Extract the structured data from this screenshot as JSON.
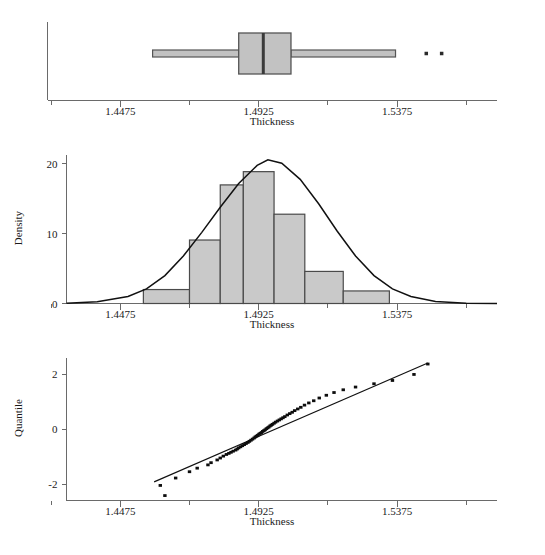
{
  "figure": {
    "width": 545,
    "height": 555,
    "background": "#ffffff",
    "fill_color": "#c9c9c9",
    "line_color": "#111111",
    "axis_color": "#6a6a6a"
  },
  "panels": {
    "boxplot": {
      "title": "",
      "xlabel": "Thickness",
      "xticks": [
        "1.4475",
        "1.4925",
        "1.5375"
      ]
    },
    "histogram": {
      "title": "",
      "xlabel": "Thickness",
      "ylabel": "Density",
      "xticks": [
        "1.4475",
        "1.4925",
        "1.5375"
      ],
      "yticks": [
        "0",
        "10",
        "20"
      ]
    },
    "qqplot": {
      "title": "",
      "xlabel": "Thickness",
      "ylabel": "Quantile",
      "xticks": [
        "1.4475",
        "1.4925",
        "1.5375"
      ],
      "yticks": [
        "-2",
        "0",
        "2"
      ]
    }
  },
  "chart_data": [
    {
      "type": "boxplot",
      "title": "",
      "xlabel": "Thickness",
      "ylabel": "",
      "xlim": [
        1.43,
        1.57
      ],
      "xticks": [
        1.4475,
        1.4925,
        1.5375
      ],
      "xticklabels": [
        "1.4475",
        "1.4925",
        "1.5375"
      ],
      "minor_xticks": [
        1.425,
        1.47,
        1.515,
        1.56
      ],
      "grid": false,
      "legend": null,
      "orientation": "horizontal",
      "stats": {
        "whisker_low": 1.458,
        "q1": 1.486,
        "median": 1.494,
        "q3": 1.503,
        "whisker_high": 1.537
      },
      "outliers": [
        1.547,
        1.552
      ]
    },
    {
      "type": "bar",
      "subtype": "histogram",
      "title": "",
      "xlabel": "Thickness",
      "ylabel": "Density",
      "xlim": [
        1.43,
        1.57
      ],
      "ylim": [
        0,
        21
      ],
      "xticks": [
        1.4475,
        1.4925,
        1.5375
      ],
      "xticklabels": [
        "1.4475",
        "1.4925",
        "1.5375"
      ],
      "yticks": [
        0,
        10,
        20
      ],
      "yticklabels": [
        "0",
        "10",
        "20"
      ],
      "minor_xticks": [
        1.425,
        1.47,
        1.515,
        1.56
      ],
      "grid": false,
      "legend": null,
      "bin_edges": [
        1.455,
        1.47,
        1.48,
        1.4875,
        1.4975,
        1.5075,
        1.52,
        1.535,
        1.545
      ],
      "bin_lefts": [
        1.455,
        1.47,
        1.48,
        1.4875,
        1.4975,
        1.5075,
        1.52,
        1.535
      ],
      "bin_rights": [
        1.47,
        1.48,
        1.4875,
        1.4975,
        1.5075,
        1.52,
        1.535,
        1.545
      ],
      "categories": [
        "1.4550-1.4700",
        "1.4700-1.4800",
        "1.4800-1.4875",
        "1.4875-1.4975",
        "1.4975-1.5075",
        "1.5075-1.5200",
        "1.5200-1.5350",
        "1.5350-1.5450"
      ],
      "values": [
        2.0,
        9.1,
        17.0,
        18.9,
        12.8,
        4.6,
        1.8,
        0.0
      ],
      "overlay_curve": {
        "name": "normal density fit",
        "type": "line",
        "mean": 1.4955,
        "sd": 0.0194,
        "peak_value": 20.6,
        "x": [
          1.43,
          1.44,
          1.45,
          1.456,
          1.462,
          1.468,
          1.474,
          1.48,
          1.486,
          1.492,
          1.4955,
          1.5,
          1.506,
          1.512,
          1.518,
          1.524,
          1.53,
          1.536,
          1.542,
          1.55,
          1.56,
          1.57
        ],
        "y": [
          0.05,
          0.25,
          1.0,
          2.1,
          4.0,
          6.8,
          10.2,
          13.8,
          17.2,
          19.8,
          20.6,
          20.1,
          17.8,
          14.3,
          10.4,
          6.8,
          4.0,
          2.1,
          1.0,
          0.3,
          0.05,
          0.01
        ]
      }
    },
    {
      "type": "scatter",
      "subtype": "normal-quantile-plot",
      "title": "",
      "xlabel": "Thickness",
      "ylabel": "Quantile",
      "xlim": [
        1.43,
        1.57
      ],
      "ylim": [
        -2.6,
        2.6
      ],
      "xticks": [
        1.4475,
        1.4925,
        1.5375
      ],
      "xticklabels": [
        "1.4475",
        "1.4925",
        "1.5375"
      ],
      "yticks": [
        -2,
        0,
        2
      ],
      "yticklabels": [
        "-2",
        "0",
        "2"
      ],
      "minor_xticks": [
        1.425,
        1.47,
        1.515,
        1.56
      ],
      "grid": false,
      "legend": null,
      "reference_line": {
        "name": "normal reference line",
        "x": [
          1.4585,
          1.5475
        ],
        "y": [
          -1.92,
          2.42
        ]
      },
      "points": {
        "x": [
          1.462,
          1.4605,
          1.4655,
          1.47,
          1.4725,
          1.476,
          1.477,
          1.479,
          1.48,
          1.481,
          1.482,
          1.4828,
          1.4835,
          1.4842,
          1.485,
          1.4855,
          1.486,
          1.4866,
          1.4872,
          1.4878,
          1.4884,
          1.489,
          1.4895,
          1.49,
          1.4905,
          1.491,
          1.4914,
          1.4918,
          1.4922,
          1.4926,
          1.493,
          1.4934,
          1.4938,
          1.4942,
          1.4946,
          1.495,
          1.4954,
          1.4958,
          1.4962,
          1.4966,
          1.497,
          1.4975,
          1.498,
          1.4986,
          1.4992,
          1.4998,
          1.5004,
          1.501,
          1.5018,
          1.5026,
          1.5034,
          1.5042,
          1.5052,
          1.5062,
          1.5074,
          1.5088,
          1.5104,
          1.5122,
          1.5145,
          1.517,
          1.52,
          1.524,
          1.53,
          1.536,
          1.543,
          1.5475
        ],
        "y": [
          -2.42,
          -2.05,
          -1.78,
          -1.55,
          -1.42,
          -1.3,
          -1.22,
          -1.12,
          -1.05,
          -0.98,
          -0.92,
          -0.88,
          -0.84,
          -0.8,
          -0.76,
          -0.72,
          -0.68,
          -0.64,
          -0.6,
          -0.56,
          -0.52,
          -0.48,
          -0.44,
          -0.4,
          -0.36,
          -0.32,
          -0.28,
          -0.25,
          -0.22,
          -0.18,
          -0.15,
          -0.12,
          -0.08,
          -0.05,
          -0.02,
          0.02,
          0.05,
          0.08,
          0.12,
          0.15,
          0.18,
          0.22,
          0.26,
          0.3,
          0.34,
          0.38,
          0.42,
          0.46,
          0.52,
          0.57,
          0.62,
          0.68,
          0.74,
          0.8,
          0.88,
          0.96,
          1.04,
          1.14,
          1.24,
          1.34,
          1.44,
          1.54,
          1.66,
          1.78,
          2.0,
          2.38
        ]
      }
    }
  ]
}
